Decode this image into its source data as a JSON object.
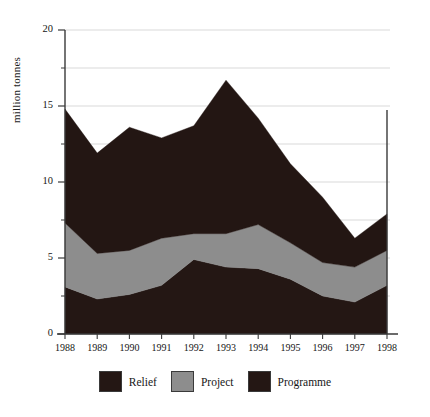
{
  "chart_data": {
    "type": "area",
    "stacked": true,
    "title": "",
    "xlabel": "",
    "ylabel": "million tonnes",
    "categories": [
      "1988",
      "1989",
      "1990",
      "1991",
      "1992",
      "1993",
      "1994",
      "1995",
      "1996",
      "1997",
      "1998"
    ],
    "x": [
      1988,
      1989,
      1990,
      1991,
      1992,
      1993,
      1994,
      1995,
      1996,
      1997,
      1998
    ],
    "ylim": [
      0,
      20
    ],
    "yticks": [
      0,
      5,
      10,
      15,
      20
    ],
    "ytick_labels": [
      "0",
      "5",
      "10",
      "15",
      "20"
    ],
    "yminor_ticks": [
      2.5,
      7.5,
      12.5,
      17.5
    ],
    "grid": true,
    "grid_axis": "y",
    "legend_position": "bottom",
    "series": [
      {
        "name": "Programme",
        "color": "#241714",
        "values": [
          3.1,
          2.3,
          2.6,
          3.2,
          4.9,
          4.4,
          4.3,
          3.6,
          2.5,
          2.1,
          3.2
        ]
      },
      {
        "name": "Project",
        "color": "#8d8d8d",
        "values": [
          4.2,
          3.0,
          2.9,
          3.1,
          1.7,
          2.2,
          2.9,
          2.4,
          2.2,
          2.3,
          2.3
        ]
      },
      {
        "name": "Relief",
        "color": "#231613",
        "values": [
          7.5,
          6.6,
          8.1,
          6.6,
          7.1,
          10.1,
          7.0,
          5.2,
          4.3,
          1.9,
          2.4
        ]
      }
    ],
    "cumulative_tops": {
      "programme": [
        3.1,
        2.3,
        2.6,
        3.2,
        4.9,
        4.4,
        4.3,
        3.6,
        2.5,
        2.1,
        3.2
      ],
      "programme_plus_project": [
        7.3,
        5.3,
        5.5,
        6.3,
        6.6,
        6.6,
        7.2,
        6.0,
        4.7,
        4.4,
        5.5
      ],
      "total": [
        14.8,
        11.9,
        13.6,
        12.9,
        13.7,
        16.7,
        14.2,
        11.2,
        9.0,
        6.3,
        7.9
      ]
    },
    "legend_entries": [
      {
        "label": "Relief",
        "color": "#241714"
      },
      {
        "label": "Project",
        "color": "#8d8d8d"
      },
      {
        "label": "Programme",
        "color": "#241714"
      }
    ]
  },
  "axis": {
    "y_label": "million tonnes",
    "y_tick_0": "0",
    "y_tick_5": "5",
    "y_tick_10": "10",
    "y_tick_15": "15",
    "y_tick_20": "20",
    "x_ticks": [
      "1988",
      "1989",
      "1990",
      "1991",
      "1992",
      "1993",
      "1994",
      "1995",
      "1996",
      "1997",
      "1998"
    ]
  },
  "legend": {
    "items": [
      {
        "label": "Relief"
      },
      {
        "label": "Project"
      },
      {
        "label": "Programme"
      }
    ]
  }
}
